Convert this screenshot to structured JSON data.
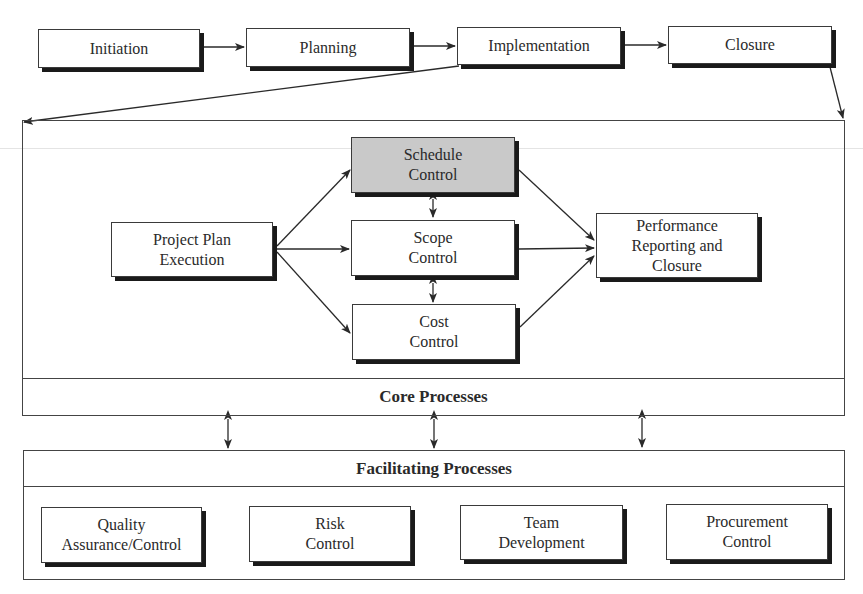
{
  "phases": [
    {
      "label": "Initiation"
    },
    {
      "label": "Planning"
    },
    {
      "label": "Implementation"
    },
    {
      "label": "Closure"
    }
  ],
  "core": {
    "title": "Core Processes",
    "project_plan": {
      "line1": "Project Plan",
      "line2": "Execution"
    },
    "schedule": {
      "line1": "Schedule",
      "line2": "Control",
      "fill": "#c9c9c9"
    },
    "scope": {
      "line1": "Scope",
      "line2": "Control"
    },
    "cost": {
      "line1": "Cost",
      "line2": "Control"
    },
    "performance": {
      "line1": "Performance",
      "line2": "Reporting and",
      "line3": "Closure"
    }
  },
  "facilitating": {
    "title": "Facilitating Processes",
    "items": [
      {
        "line1": "Quality",
        "line2": "Assurance/Control"
      },
      {
        "line1": "Risk",
        "line2": "Control"
      },
      {
        "line1": "Team",
        "line2": "Development"
      },
      {
        "line1": "Procurement",
        "line2": "Control"
      }
    ]
  },
  "colors": {
    "line": "#2a2a2a",
    "shadow": "#1a1a1a",
    "highlight_fill": "#c9c9c9"
  }
}
